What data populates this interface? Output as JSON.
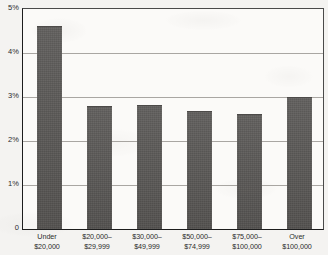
{
  "chart_data": {
    "type": "bar",
    "title": "",
    "xlabel": "",
    "ylabel": "",
    "categories": [
      "Under $20,000",
      "$20,000–$29,999",
      "$30,000–$49,999",
      "$50,000–$74,999",
      "$75,000–$100,000",
      "Over $100,000"
    ],
    "category_lines": [
      [
        "Under",
        "$20,000"
      ],
      [
        "$20,000–",
        "$29,999"
      ],
      [
        "$30,000–",
        "$49,999"
      ],
      [
        "$50,000–",
        "$74,999"
      ],
      [
        "$75,000–",
        "$100,000"
      ],
      [
        "Over",
        "$100,000"
      ]
    ],
    "values": [
      4.6,
      2.77,
      2.8,
      2.66,
      2.59,
      2.98
    ],
    "ylim": [
      0,
      5
    ],
    "ytick_values": [
      5,
      4,
      3,
      2,
      1,
      0
    ],
    "ytick_labels": [
      "5%",
      "4%",
      "3%",
      "2%",
      "1%",
      "0"
    ],
    "grid": true,
    "grid_axis": "y",
    "legend": "none",
    "series": [
      {
        "name": "",
        "values": [
          4.6,
          2.77,
          2.8,
          2.66,
          2.59,
          2.98
        ]
      }
    ],
    "colors": {
      "bar_fill": "#585654",
      "gridline": "#a9a6a2",
      "axis": "#1d1d1d",
      "text": "#2b2b2b",
      "plot_background": "#fbfaf8",
      "page_background": "#f4f3f1"
    }
  }
}
